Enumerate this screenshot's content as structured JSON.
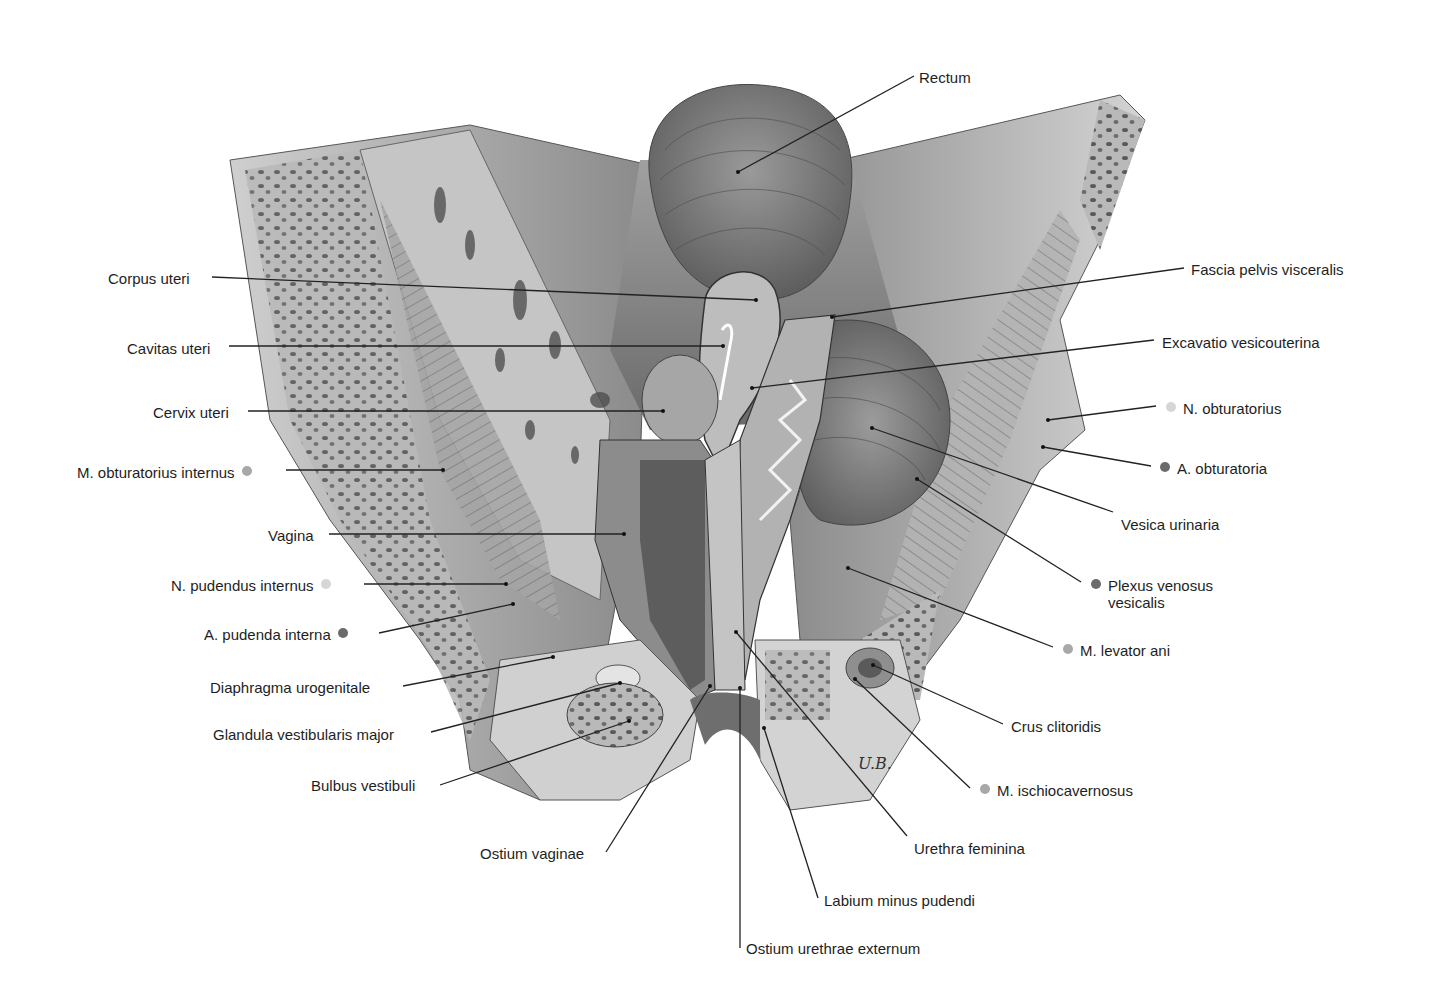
{
  "figure": {
    "signature": "U.B.",
    "dot_colors": {
      "light": "#d6d6d6",
      "medium": "#a8a8a8",
      "dark": "#6b6b6b"
    }
  },
  "labels": [
    {
      "id": "rectum",
      "text": "Rectum",
      "side": "right",
      "x": 919,
      "y": 67,
      "dot": null,
      "line": [
        914,
        76,
        738,
        172
      ]
    },
    {
      "id": "corpus-uteri",
      "text": "Corpus uteri",
      "side": "left",
      "x": 108,
      "y": 268,
      "dot": null,
      "line": [
        212,
        277,
        756,
        300
      ]
    },
    {
      "id": "fascia-pelvis-visceralis",
      "text": "Fascia pelvis visceralis",
      "side": "right",
      "x": 1191,
      "y": 259,
      "dot": null,
      "line": [
        1184,
        268,
        832,
        317
      ]
    },
    {
      "id": "cavitas-uteri",
      "text": "Cavitas uteri",
      "side": "left",
      "x": 127,
      "y": 338,
      "dot": null,
      "line": [
        229,
        346,
        723,
        346
      ]
    },
    {
      "id": "excavatio-vesicouterina",
      "text": "Excavatio vesicouterina",
      "side": "right",
      "x": 1162,
      "y": 332,
      "dot": null,
      "line": [
        1154,
        340,
        752,
        388
      ]
    },
    {
      "id": "cervix-uteri",
      "text": "Cervix uteri",
      "side": "left",
      "x": 153,
      "y": 402,
      "dot": null,
      "line": [
        248,
        411,
        663,
        411
      ]
    },
    {
      "id": "n-obturatorius",
      "text": "N. obturatorius",
      "side": "right",
      "x": 1166,
      "y": 398,
      "dot": "light",
      "line": [
        1156,
        406,
        1048,
        420
      ]
    },
    {
      "id": "m-obturatorius-internus",
      "text": "M. obturatorius internus",
      "side": "left",
      "x": 77,
      "y": 462,
      "dot": "medium",
      "line": [
        286,
        470,
        443,
        470
      ]
    },
    {
      "id": "a-obturatoria",
      "text": "A. obturatoria",
      "side": "right",
      "x": 1160,
      "y": 458,
      "dot": "dark",
      "line": [
        1151,
        466,
        1043,
        447
      ]
    },
    {
      "id": "vesica-urinaria",
      "text": "Vesica urinaria",
      "side": "right",
      "x": 1121,
      "y": 514,
      "dot": null,
      "line": [
        1113,
        512,
        872,
        428
      ]
    },
    {
      "id": "vagina",
      "text": "Vagina",
      "side": "left",
      "x": 268,
      "y": 525,
      "dot": null,
      "line": [
        329,
        534,
        624,
        534
      ]
    },
    {
      "id": "n-pudendus-internus",
      "text": "N. pudendus internus",
      "side": "left",
      "x": 171,
      "y": 575,
      "dot": "light",
      "line": [
        364,
        584,
        506,
        584
      ]
    },
    {
      "id": "plexus-venosus-vesicalis",
      "text": "Plexus venosus",
      "text2": "vesicalis",
      "side": "right",
      "x": 1091,
      "y": 575,
      "dot": "dark",
      "line": [
        1081,
        582,
        917,
        479
      ]
    },
    {
      "id": "a-pudenda-interna",
      "text": "A. pudenda interna",
      "side": "left",
      "x": 204,
      "y": 624,
      "dot": "dark",
      "line": [
        379,
        633,
        513,
        604
      ]
    },
    {
      "id": "m-levator-ani",
      "text": "M. levator ani",
      "side": "right",
      "x": 1063,
      "y": 640,
      "dot": "medium",
      "line": [
        1053,
        647,
        848,
        568
      ]
    },
    {
      "id": "diaphragma-urogenitale",
      "text": "Diaphragma urogenitale",
      "side": "left",
      "x": 210,
      "y": 677,
      "dot": null,
      "line": [
        403,
        686,
        553,
        657
      ]
    },
    {
      "id": "glandula-vestibularis-major",
      "text": "Glandula vestibularis major",
      "side": "left",
      "x": 213,
      "y": 724,
      "dot": null,
      "line": [
        431,
        732,
        620,
        683
      ]
    },
    {
      "id": "crus-clitoridis",
      "text": "Crus clitoridis",
      "side": "right",
      "x": 1011,
      "y": 716,
      "dot": null,
      "line": [
        1003,
        724,
        873,
        665
      ]
    },
    {
      "id": "bulbus-vestibuli",
      "text": "Bulbus vestibuli",
      "side": "left",
      "x": 311,
      "y": 775,
      "dot": null,
      "line": [
        440,
        785,
        629,
        721
      ]
    },
    {
      "id": "m-ischiocavernosus",
      "text": "M. ischiocavernosus",
      "side": "right",
      "x": 980,
      "y": 780,
      "dot": "medium",
      "line": [
        970,
        788,
        855,
        679
      ]
    },
    {
      "id": "urethra-feminina",
      "text": "Urethra feminina",
      "side": "right",
      "x": 914,
      "y": 838,
      "dot": null,
      "line": [
        907,
        836,
        736,
        632
      ]
    },
    {
      "id": "ostium-vaginae",
      "text": "Ostium vaginae",
      "side": "left",
      "x": 480,
      "y": 843,
      "dot": null,
      "line": [
        606,
        852,
        710,
        686
      ]
    },
    {
      "id": "labium-minus-pudendi",
      "text": "Labium minus pudendi",
      "side": "right",
      "x": 824,
      "y": 890,
      "dot": null,
      "line": [
        818,
        898,
        764,
        728
      ]
    },
    {
      "id": "ostium-urethrae-externum",
      "text": "Ostium urethrae externum",
      "side": "right",
      "x": 746,
      "y": 938,
      "dot": null,
      "line": [
        740,
        948,
        740,
        688
      ]
    }
  ]
}
